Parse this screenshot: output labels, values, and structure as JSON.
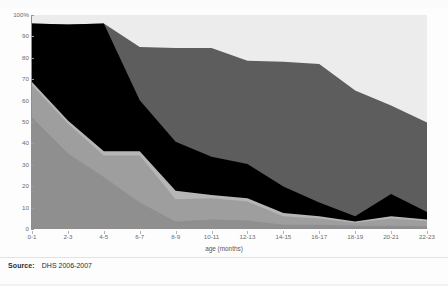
{
  "source": {
    "label": "Source:",
    "value": "DHS 2006-2007"
  },
  "chart_data": {
    "type": "area",
    "stacked": "100%",
    "title": "",
    "subtitle": "",
    "xlabel": "age (months)",
    "ylabel": "",
    "ylim": [
      0,
      100
    ],
    "yticks": [
      0,
      10,
      20,
      30,
      40,
      50,
      60,
      70,
      80,
      90,
      100
    ],
    "ytick_labels": [
      "0",
      "10",
      "20",
      "30",
      "40",
      "50",
      "60",
      "70",
      "80",
      "90",
      "100%"
    ],
    "grid": false,
    "legend": "none",
    "categories": [
      "0-1",
      "2-3",
      "4-5",
      "6-7",
      "8-9",
      "10-11",
      "12-13",
      "14-15",
      "16-17",
      "18-19",
      "20-21",
      "22-23"
    ],
    "series": [
      {
        "name": "band-1-dark-gray",
        "color": "#8f8f8f",
        "values": [
          52,
          35,
          24,
          12,
          3,
          4,
          3.5,
          1.5,
          1.5,
          1,
          1,
          0.8
        ]
      },
      {
        "name": "band-2-mid-gray",
        "color": "#9e9e9e",
        "values": [
          15,
          14,
          10,
          22,
          10.5,
          10,
          9,
          4,
          3,
          1.5,
          3.5,
          2.5
        ]
      },
      {
        "name": "band-3-light-gray",
        "color": "#b6b6b6",
        "values": [
          1.5,
          1.5,
          2,
          2,
          4,
          1.5,
          1.5,
          1.5,
          1,
          0.5,
          1,
          0.7
        ]
      },
      {
        "name": "band-4-black",
        "color": "#000000",
        "values": [
          27.5,
          45,
          60,
          24,
          23,
          18,
          16,
          12.5,
          6.5,
          2.5,
          10.5,
          3.5
        ]
      },
      {
        "name": "band-5-top-gray",
        "color": "#5d5d5d",
        "values": [
          0,
          0,
          0,
          25,
          44,
          51,
          48.5,
          58.5,
          65,
          59,
          41.5,
          42
        ]
      },
      {
        "name": "band-6-empty",
        "color": "#ececec",
        "values": [
          4,
          4,
          4,
          15,
          15.5,
          15.5,
          21.5,
          22,
          23,
          35.5,
          42.5,
          50.5
        ]
      }
    ],
    "cumulative_tops": {
      "band-1-dark-gray": [
        52,
        35,
        24,
        12,
        3,
        4,
        3.5,
        1.5,
        1.5,
        1,
        1,
        0.8
      ],
      "band-2-mid-gray": [
        67,
        49,
        34,
        34,
        13.5,
        14,
        12.5,
        5.5,
        4.5,
        2.5,
        4.5,
        3.3
      ],
      "band-3-light-gray": [
        68.5,
        50.5,
        36,
        36,
        17.5,
        15.5,
        14,
        7,
        5.5,
        3,
        5.5,
        4
      ],
      "band-4-black": [
        96,
        95.5,
        96,
        60,
        40.5,
        33.5,
        30,
        19.5,
        12,
        5.5,
        16,
        7.5
      ],
      "band-5-top-gray": [
        96,
        95.5,
        96,
        85,
        84.5,
        84.5,
        78.5,
        78,
        77,
        64.5,
        57.5,
        49.5
      ]
    }
  }
}
